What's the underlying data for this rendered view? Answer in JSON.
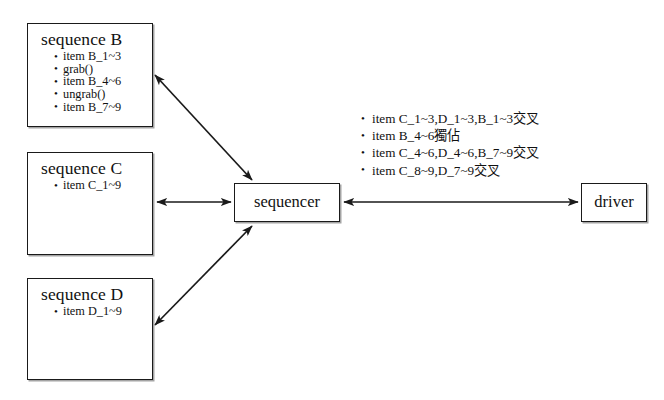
{
  "diagram": {
    "nodes": {
      "sequence_b": {
        "title": "sequence B",
        "items": [
          "item B_1~3",
          "grab()",
          "item B_4~6",
          "ungrab()",
          "item B_7~9"
        ]
      },
      "sequence_c": {
        "title": "sequence C",
        "items": [
          "item C_1~9"
        ]
      },
      "sequence_d": {
        "title": "sequence D",
        "items": [
          "item D_1~9"
        ]
      },
      "sequencer": {
        "label": "sequencer"
      },
      "driver": {
        "label": "driver"
      }
    },
    "annotations": [
      "item C_1~3,D_1~3,B_1~3交叉",
      "item B_4~6獨佔",
      "item C_4~6,D_4~6,B_7~9交叉",
      "item C_8~9,D_7~9交叉"
    ],
    "colors": {
      "background": "#ffffff",
      "stroke": "#1a1a1a",
      "text": "#111111",
      "shadow": "#5a5a5a"
    }
  }
}
